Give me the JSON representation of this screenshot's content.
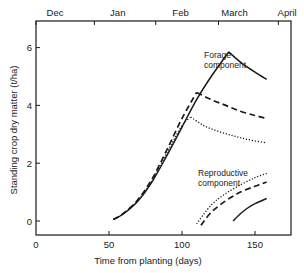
{
  "chart_data": {
    "type": "line",
    "title": "",
    "xlabel": "Time from planting (days)",
    "ylabel": "Standing crop dry matter (t/ha)",
    "xlim": [
      0,
      175
    ],
    "ylim": [
      -0.5,
      6.9
    ],
    "xticks": [
      0,
      50,
      100,
      150
    ],
    "xtick_labels": [
      "0",
      "50",
      "100",
      "150"
    ],
    "yticks": [
      0,
      2,
      4,
      6
    ],
    "ytick_labels": [
      "0",
      "2",
      "4",
      "6"
    ],
    "origin_label": "0",
    "top_axis": {
      "labels": [
        "Dec",
        "Jan",
        "Feb",
        "March",
        "April"
      ],
      "label_x_days": [
        13,
        56,
        99,
        136,
        172
      ],
      "tick_x_days": [
        0,
        40,
        82,
        125,
        166
      ]
    },
    "grid": false,
    "legend": null,
    "annotations": [
      {
        "text": "Forage\ncomponent",
        "x_day": 116,
        "y": 6.1
      },
      {
        "text": "Reproductive\ncomponent",
        "x_day": 116,
        "y": 1.6
      }
    ],
    "series": [
      {
        "name": "Forage (solid)",
        "component": "forage",
        "style": "solid",
        "x": [
          53,
          60,
          70,
          80,
          90,
          100,
          110,
          120,
          132,
          140,
          150,
          158
        ],
        "y": [
          0.05,
          0.25,
          0.7,
          1.4,
          2.3,
          3.25,
          4.2,
          5.0,
          5.85,
          5.5,
          5.15,
          4.9
        ]
      },
      {
        "name": "Forage (dashed)",
        "component": "forage",
        "style": "dashed",
        "x": [
          53,
          60,
          70,
          80,
          90,
          100,
          110,
          120,
          130,
          140,
          150,
          158
        ],
        "y": [
          0.05,
          0.27,
          0.75,
          1.5,
          2.5,
          3.55,
          4.45,
          4.2,
          4.0,
          3.8,
          3.65,
          3.55
        ]
      },
      {
        "name": "Forage (dotted)",
        "component": "forage",
        "style": "dotted",
        "x": [
          53,
          60,
          70,
          80,
          90,
          100,
          106,
          115,
          125,
          135,
          145,
          158
        ],
        "y": [
          0.05,
          0.26,
          0.72,
          1.45,
          2.4,
          3.3,
          3.6,
          3.3,
          3.1,
          2.95,
          2.82,
          2.7
        ]
      },
      {
        "name": "Reproductive (dotted)",
        "component": "reproductive",
        "style": "dotted",
        "x": [
          110,
          120,
          130,
          140,
          150,
          158
        ],
        "y": [
          -0.1,
          0.55,
          0.95,
          1.25,
          1.5,
          1.65
        ]
      },
      {
        "name": "Reproductive (dashed)",
        "component": "reproductive",
        "style": "dashed",
        "x": [
          113,
          120,
          130,
          140,
          150,
          158
        ],
        "y": [
          -0.15,
          0.3,
          0.7,
          1.0,
          1.2,
          1.35
        ]
      },
      {
        "name": "Reproductive (solid)",
        "component": "reproductive",
        "style": "solid",
        "x": [
          135,
          140,
          145,
          150,
          158
        ],
        "y": [
          0.0,
          0.25,
          0.45,
          0.6,
          0.78
        ]
      }
    ]
  },
  "colors": {
    "ink": "#1a1a1a",
    "background": "#ffffff"
  }
}
